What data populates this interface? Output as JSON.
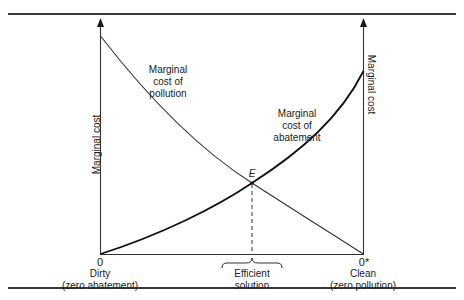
{
  "diagram": {
    "type": "economics-curve-diagram",
    "axes": {
      "left_ylabel": "Marginal cost",
      "right_ylabel": "Marginal cost",
      "left_origin": "0",
      "right_origin": "0*",
      "left_end_label": "Dirty",
      "left_end_sublabel": "(zero abatement)",
      "right_end_label": "Clean",
      "right_end_sublabel": "(zero pollution)"
    },
    "curves": [
      {
        "name": "Marginal cost of pollution",
        "line1": "Marginal",
        "line2": "cost of",
        "line3": "pollution",
        "shape": "decreasing, convex",
        "start": [
          0,
          0.82
        ],
        "end": [
          1,
          0
        ]
      },
      {
        "name": "Marginal cost of abatement",
        "line1": "Marginal",
        "line2": "cost of",
        "line3": "abatement",
        "shape": "increasing, convex",
        "start": [
          0,
          0
        ],
        "end": [
          1,
          0.77
        ]
      }
    ],
    "intersection": {
      "label": "E",
      "x": 0.58,
      "y": 0.3
    },
    "efficient": {
      "line1": "Efficient",
      "line2": "solution"
    },
    "colors": {
      "ink": "#1a1a1a",
      "pollution_curve": "#333333",
      "abatement_curve": "#111111"
    }
  }
}
